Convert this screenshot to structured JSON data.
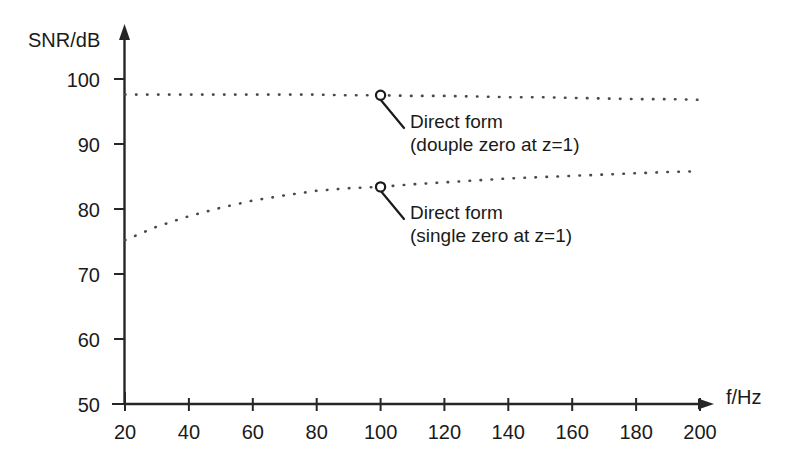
{
  "chart_data": {
    "type": "line",
    "title": "",
    "subtitle": "",
    "xlabel": "f/Hz",
    "ylabel": "SNR/dB",
    "xlim": [
      20,
      200
    ],
    "ylim": [
      50,
      100
    ],
    "xticks": [
      20,
      40,
      60,
      80,
      100,
      120,
      140,
      160,
      180,
      200
    ],
    "yticks": [
      50,
      60,
      70,
      80,
      90,
      100
    ],
    "xtick_labels": [
      "20",
      "40",
      "60",
      "80",
      "100",
      "120",
      "140",
      "160",
      "180",
      "200"
    ],
    "ytick_labels": [
      "50",
      "60",
      "70",
      "80",
      "90",
      "100"
    ],
    "grid": false,
    "legend_position": "none",
    "line_style": "dotted",
    "series": [
      {
        "name": "Direct form (douple zero at z=1)",
        "style": "dotted",
        "color": "#4a4a4a",
        "x": [
          20,
          30,
          40,
          50,
          60,
          70,
          80,
          90,
          100,
          110,
          120,
          130,
          140,
          150,
          160,
          170,
          180,
          190,
          200
        ],
        "values": [
          97.6,
          97.6,
          97.6,
          97.6,
          97.6,
          97.6,
          97.6,
          97.5,
          97.5,
          97.4,
          97.4,
          97.3,
          97.2,
          97.2,
          97.1,
          97.0,
          96.9,
          96.9,
          96.8
        ],
        "marker_point": {
          "x": 100,
          "y": 97.5
        }
      },
      {
        "name": "Direct form (single zero at z=1)",
        "style": "dotted",
        "color": "#4a4a4a",
        "x": [
          20,
          30,
          40,
          50,
          60,
          70,
          80,
          90,
          100,
          110,
          120,
          130,
          140,
          150,
          160,
          170,
          180,
          190,
          200
        ],
        "values": [
          75.2,
          77.3,
          78.9,
          80.2,
          81.3,
          82.1,
          82.8,
          83.2,
          83.4,
          83.8,
          84.1,
          84.4,
          84.7,
          84.9,
          85.1,
          85.3,
          85.5,
          85.7,
          85.8
        ],
        "marker_point": {
          "x": 100,
          "y": 83.4
        }
      }
    ],
    "annotations": [
      {
        "id": "annotation-double-zero",
        "line1": "Direct form",
        "line2": "(douple zero at z=1)",
        "anchor_x": 100,
        "anchor_y": 97.5
      },
      {
        "id": "annotation-single-zero",
        "line1": "Direct form",
        "line2": "(single zero at z=1)",
        "anchor_x": 100,
        "anchor_y": 83.4
      }
    ]
  },
  "axes": {
    "y_title": "SNR/dB",
    "x_title": "f/Hz",
    "y_labels": {
      "t100": "100",
      "t90": "90",
      "t80": "80",
      "t70": "70",
      "t60": "60",
      "t50": "50"
    },
    "x_labels": {
      "t20": "20",
      "t40": "40",
      "t60": "60",
      "t80": "80",
      "t100": "100",
      "t120": "120",
      "t140": "140",
      "t160": "160",
      "t180": "180",
      "t200": "200"
    }
  },
  "annotations": {
    "upper": {
      "line1": "Direct form",
      "line2": "(douple zero at z=1)"
    },
    "lower": {
      "line1": "Direct form",
      "line2": "(single zero at z=1)"
    }
  },
  "colors": {
    "background": "#ffffff",
    "axis": "#262626",
    "curve": "#4a4a4a",
    "text": "#1a1a1a"
  }
}
